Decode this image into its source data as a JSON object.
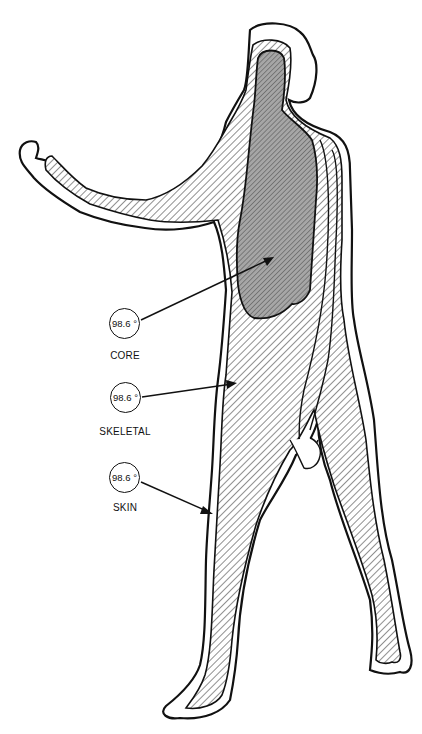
{
  "figure": {
    "layers": [
      "core",
      "skeletal",
      "skin"
    ]
  },
  "labels": [
    {
      "id": "core",
      "temperature": "98.6 °",
      "name": "CORE"
    },
    {
      "id": "skeletal",
      "temperature": "98.6 °",
      "name": "SKELETAL"
    },
    {
      "id": "skin",
      "temperature": "98.6 °",
      "name": "SKIN"
    }
  ],
  "colors": {
    "line": "#111111",
    "core_fill": "#a6a6a6",
    "background": "#ffffff"
  }
}
